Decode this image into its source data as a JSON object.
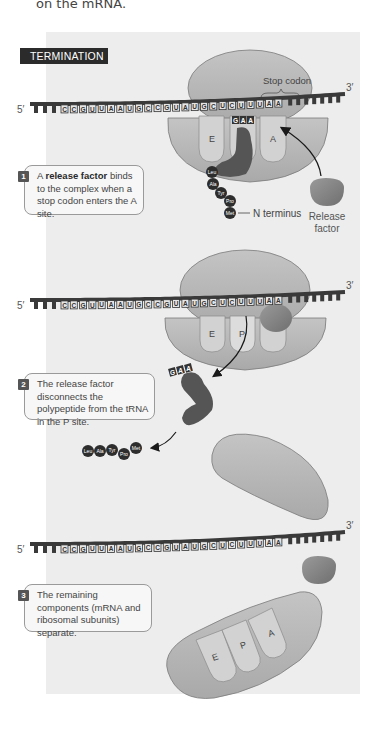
{
  "intro_text": "on the mRNA.",
  "section_label": "TERMINATION",
  "mrna": {
    "five_prime": "5′",
    "three_prime": "3′",
    "sequence": [
      "C",
      "C",
      "G",
      "U",
      "U",
      "A",
      "A",
      "U",
      "G",
      "C",
      "C",
      "G",
      "U",
      "A",
      "U",
      "G",
      "C",
      "U",
      "C",
      "U",
      "U",
      "U",
      "A",
      "A"
    ],
    "stop_codon_indices": [
      21,
      22,
      23
    ]
  },
  "steps": [
    {
      "number": "1",
      "text_before": "A ",
      "text_bold": "release factor",
      "text_after": " binds to the complex when a stop codon enters the A site."
    },
    {
      "number": "2",
      "text_before": "The release factor disconnects the polypeptide from the tRNA in the P site.",
      "text_bold": "",
      "text_after": ""
    },
    {
      "number": "3",
      "text_before": "The remaining components (mRNA and ribosomal subunits) separate.",
      "text_bold": "",
      "text_after": ""
    }
  ],
  "labels": {
    "stop_codon": "Stop codon",
    "release_factor_line1": "Release",
    "release_factor_line2": "factor",
    "n_terminus": "N terminus"
  },
  "sites": {
    "e": "E",
    "p": "P",
    "a": "A"
  },
  "anticodon": [
    "G",
    "A",
    "A"
  ],
  "polypeptide": [
    "Leu",
    "Ala",
    "Tyr",
    "Pro",
    "Met"
  ],
  "colors": {
    "panel_bg": "#ededed",
    "ribosome_fill": "#b8b8b8",
    "ribosome_stroke": "#7a7a7a",
    "site_fill": "#d2d2d2",
    "mrna_backbone": "#3a3a3a",
    "trna_fill": "#555555",
    "release_factor_fill": "#8a8a8a",
    "amino_acid_fill": "#2d2d2d",
    "label_bg": "#2b2b2b"
  }
}
